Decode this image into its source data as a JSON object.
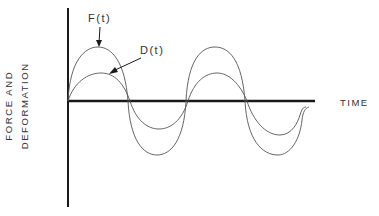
{
  "diagram": {
    "y_axis_label_line1": "FORCE AND",
    "y_axis_label_line2": "DEFORMATION",
    "x_axis_label": "TIME",
    "curves": [
      {
        "name": "F(t)",
        "label": "F(t)",
        "description": "force curve, larger amplitude"
      },
      {
        "name": "D(t)",
        "label": "D(t)",
        "description": "deformation curve, smaller amplitude"
      }
    ],
    "colors": {
      "axis": "#1a1a1a",
      "curve": "#555555",
      "text": "#333333",
      "background": "#ffffff"
    }
  }
}
